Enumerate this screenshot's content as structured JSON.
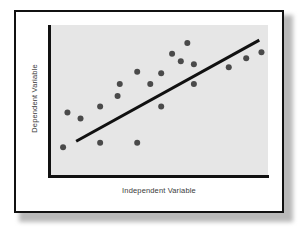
{
  "figure": {
    "kind": "scatter-plot-illustration",
    "card_border_color": "#111111",
    "card_background": "#ffffff",
    "page_background": "#ffffff"
  },
  "chart_data": {
    "type": "scatter",
    "title": "",
    "subtitle": "",
    "xlabel": "Independent Variable",
    "ylabel": "Dependent Variable",
    "xlim": [
      0,
      100
    ],
    "ylim": [
      0,
      100
    ],
    "xticks": [],
    "yticks": [],
    "xticklabels": [],
    "yticklabels": [],
    "grid": false,
    "legend": null,
    "legend_position": "none",
    "plot_background": "#e6e6e6",
    "axis_color": "#111111",
    "axis_style": "left-and-bottom-spines-only",
    "point_color": "#4a4a4a",
    "point_radius_px": 3,
    "point_count": 20,
    "points": [
      {
        "x": 6,
        "y": 19
      },
      {
        "x": 8,
        "y": 42
      },
      {
        "x": 14,
        "y": 38
      },
      {
        "x": 23,
        "y": 46
      },
      {
        "x": 23,
        "y": 22
      },
      {
        "x": 31,
        "y": 53
      },
      {
        "x": 32,
        "y": 61
      },
      {
        "x": 40,
        "y": 22
      },
      {
        "x": 40,
        "y": 69
      },
      {
        "x": 46,
        "y": 61
      },
      {
        "x": 51,
        "y": 68
      },
      {
        "x": 51,
        "y": 46
      },
      {
        "x": 56,
        "y": 81
      },
      {
        "x": 60,
        "y": 76
      },
      {
        "x": 63,
        "y": 88
      },
      {
        "x": 66,
        "y": 61
      },
      {
        "x": 66,
        "y": 74
      },
      {
        "x": 82,
        "y": 72
      },
      {
        "x": 90,
        "y": 78
      },
      {
        "x": 97,
        "y": 82
      }
    ],
    "trendline": {
      "label": "",
      "color": "#111111",
      "width_px": 3,
      "start": {
        "x": 12,
        "y": 23
      },
      "end": {
        "x": 96,
        "y": 90
      }
    },
    "annotations": []
  }
}
